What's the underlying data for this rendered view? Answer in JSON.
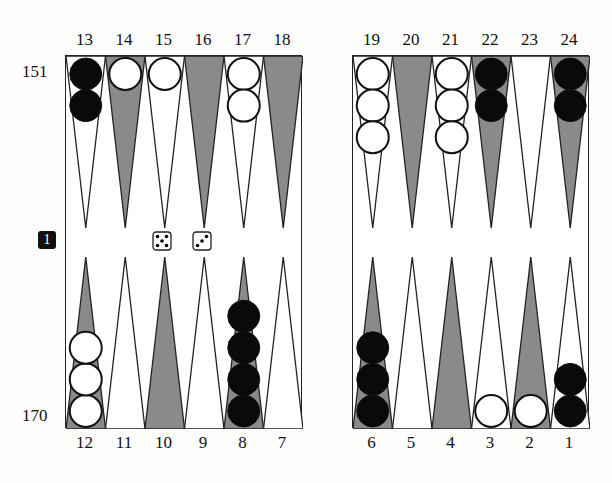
{
  "pip_counts": {
    "top": "151",
    "bottom": "170"
  },
  "cube": {
    "value": "1"
  },
  "dice": [
    5,
    3
  ],
  "colors": {
    "dark_point": "#8a8a8a",
    "light_point": "#ffffff",
    "black_checker": "#0a0a0a",
    "white_checker": "#ffffff",
    "border": "#222222"
  },
  "top_labels_left": [
    "13",
    "14",
    "15",
    "16",
    "17",
    "18"
  ],
  "top_labels_right": [
    "19",
    "20",
    "21",
    "22",
    "23",
    "24"
  ],
  "bottom_labels_left": [
    "12",
    "11",
    "10",
    "9",
    "8",
    "7"
  ],
  "bottom_labels_right": [
    "6",
    "5",
    "4",
    "3",
    "2",
    "1"
  ],
  "points": {
    "13": {
      "color": "black",
      "count": 2
    },
    "14": {
      "color": "white",
      "count": 1
    },
    "15": {
      "color": "white",
      "count": 1
    },
    "16": {
      "color": "none",
      "count": 0
    },
    "17": {
      "color": "white",
      "count": 2
    },
    "18": {
      "color": "none",
      "count": 0
    },
    "19": {
      "color": "white",
      "count": 3
    },
    "20": {
      "color": "none",
      "count": 0
    },
    "21": {
      "color": "white",
      "count": 3
    },
    "22": {
      "color": "black",
      "count": 2
    },
    "23": {
      "color": "none",
      "count": 0
    },
    "24": {
      "color": "black",
      "count": 2
    },
    "12": {
      "color": "white",
      "count": 3
    },
    "11": {
      "color": "none",
      "count": 0
    },
    "10": {
      "color": "none",
      "count": 0
    },
    "9": {
      "color": "none",
      "count": 0
    },
    "8": {
      "color": "black",
      "count": 4
    },
    "7": {
      "color": "none",
      "count": 0
    },
    "6": {
      "color": "black",
      "count": 3
    },
    "5": {
      "color": "none",
      "count": 0
    },
    "4": {
      "color": "none",
      "count": 0
    },
    "3": {
      "color": "white",
      "count": 1
    },
    "2": {
      "color": "white",
      "count": 1
    },
    "1": {
      "color": "black",
      "count": 2
    }
  }
}
